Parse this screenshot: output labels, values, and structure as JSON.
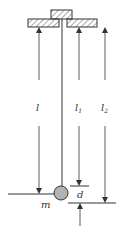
{
  "diagram": {
    "type": "pendulum-dimension-diagram",
    "labels": {
      "l": "l",
      "l1_base": "l",
      "l1_sub": "1",
      "l2_base": "l",
      "l2_sub": "2",
      "m": "m",
      "d": "d"
    },
    "colors": {
      "line": "#333333",
      "bob_fill": "#b3b3b3",
      "hatch": "#555555"
    }
  }
}
